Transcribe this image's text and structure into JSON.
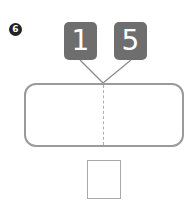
{
  "question": {
    "number": "6",
    "parts": [
      "1",
      "5"
    ],
    "whole_value": "",
    "answer_value": ""
  },
  "colors": {
    "box_fill": "#6e6e6e",
    "bar_border": "#9a9a9a",
    "badge_fill": "#222222"
  }
}
